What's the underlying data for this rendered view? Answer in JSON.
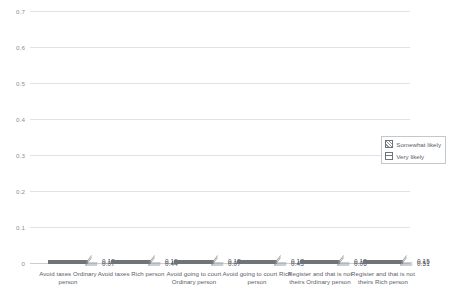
{
  "chart_data": {
    "type": "bar",
    "title": "",
    "subtitle": "",
    "xlabel": "",
    "ylabel": "",
    "stacked": true,
    "grid": true,
    "legend_position": "right",
    "ylim": [
      0,
      0.7
    ],
    "yticks": [
      "0",
      "0.1",
      "0.2",
      "0.3",
      "0.4",
      "0.5",
      "0.6",
      "0.7"
    ],
    "ytick_values": [
      0,
      0.1,
      0.2,
      0.3,
      0.4,
      0.5,
      0.6,
      0.7
    ],
    "categories": [
      "Avoid taxes Ordinary person",
      "Avoid taxes Rich person",
      "Avoid going to court Ordinary person",
      "Avoid going to court Rich person",
      "Register and that is not theirs Ordinary person",
      "Register and that is not theirs Rich person"
    ],
    "series": [
      {
        "name": "Very likely",
        "pattern": "horizontal-lines",
        "values": [
          0.07,
          0.44,
          0.07,
          0.43,
          0.06,
          0.51
        ]
      },
      {
        "name": "Somewhat likely",
        "pattern": "diagonal-hatch",
        "values": [
          0.12,
          0.19,
          0.12,
          0.17,
          0.12,
          0.15
        ]
      }
    ],
    "totals": [
      0.19,
      0.63,
      0.19,
      0.6,
      0.18,
      0.66
    ],
    "data_labels": {
      "somewhat": [
        "0.12",
        "0.19",
        "0.12",
        "0.17",
        "0.12",
        "0.15"
      ],
      "very": [
        "0.07",
        "0.44",
        "0.07",
        "0.43",
        "0.06",
        "0.51"
      ]
    }
  },
  "legend": {
    "items": [
      {
        "label": "Somewhat likely"
      },
      {
        "label": "Very likely"
      }
    ]
  },
  "colors": {
    "grid": "#dfe3e8",
    "axis_text": "#8a8f96",
    "label_text": "#5b6066",
    "bar_outline": "#6f7479",
    "hatch": "#8d9298",
    "background": "#ffffff"
  }
}
